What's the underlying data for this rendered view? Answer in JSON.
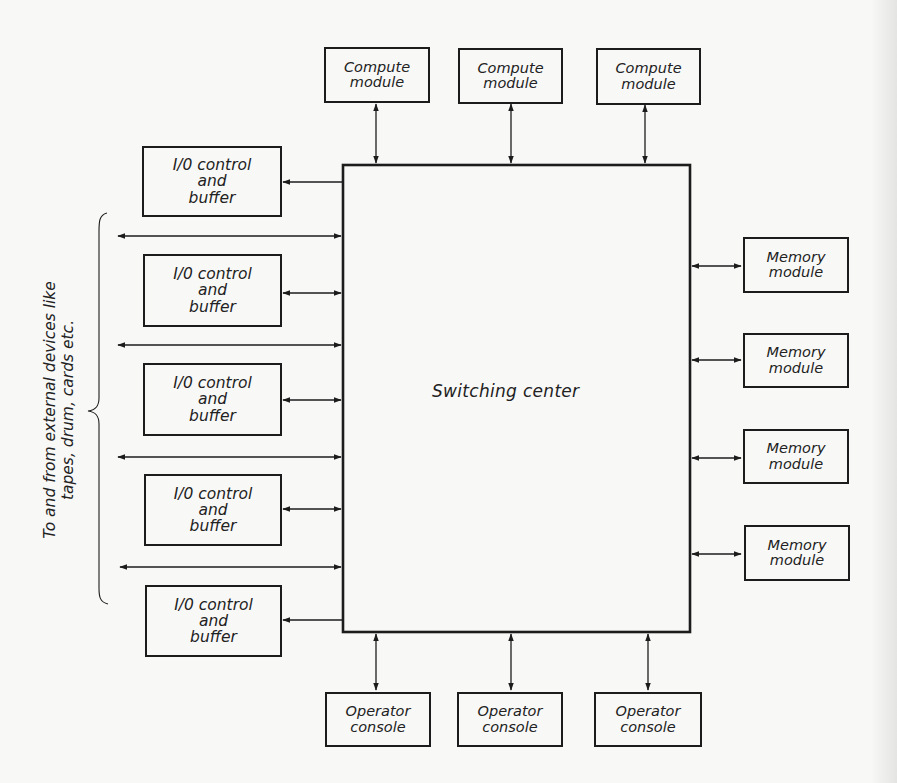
{
  "diagram": {
    "center": {
      "label": "Switching center"
    },
    "compute_modules": [
      {
        "line1": "Compute",
        "line2": "module"
      },
      {
        "line1": "Compute",
        "line2": "module"
      },
      {
        "line1": "Compute",
        "line2": "module"
      }
    ],
    "io_units": [
      {
        "line1": "I/0 control",
        "line2": "and",
        "line3": "buffer",
        "connection": "from-center"
      },
      {
        "line1": "I/0 control",
        "line2": "and",
        "line3": "buffer",
        "connection": "bidirectional"
      },
      {
        "line1": "I/0 control",
        "line2": "and",
        "line3": "buffer",
        "connection": "bidirectional"
      },
      {
        "line1": "I/0 control",
        "line2": "and",
        "line3": "buffer",
        "connection": "bidirectional"
      },
      {
        "line1": "I/0 control",
        "line2": "and",
        "line3": "buffer",
        "connection": "from-center"
      }
    ],
    "memory_modules": [
      {
        "line1": "Memory",
        "line2": "module"
      },
      {
        "line1": "Memory",
        "line2": "module"
      },
      {
        "line1": "Memory",
        "line2": "module"
      },
      {
        "line1": "Memory",
        "line2": "module"
      }
    ],
    "operator_consoles": [
      {
        "line1": "Operator",
        "line2": "console"
      },
      {
        "line1": "Operator",
        "line2": "console"
      },
      {
        "line1": "Operator",
        "line2": "console"
      }
    ],
    "external": {
      "line1": "To and from external devices like",
      "line2": "tapes, drum, cards etc.",
      "external_links": 4
    }
  },
  "colors": {
    "ink": "#1c1c1c",
    "paper": "#f8f8f7"
  }
}
